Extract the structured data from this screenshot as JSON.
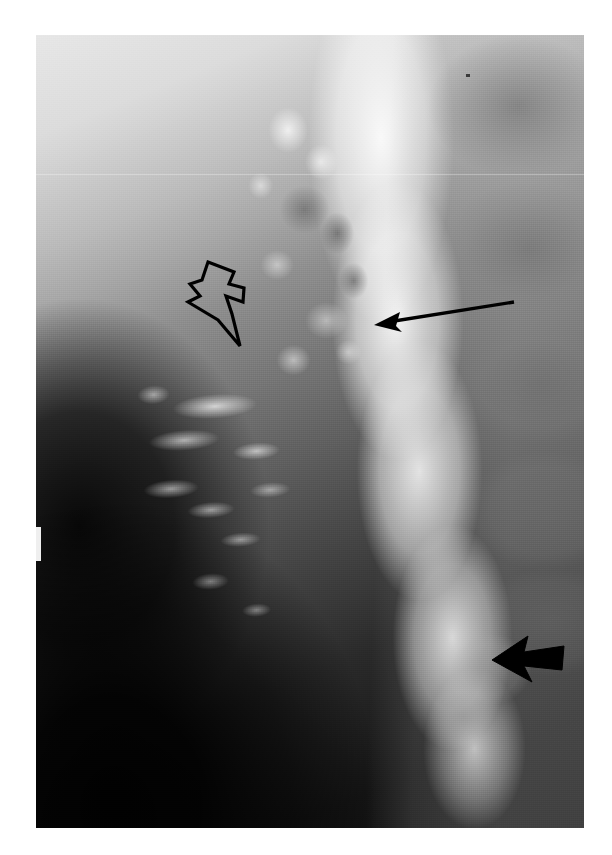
{
  "figure": {
    "kind": "radiograph",
    "modality": "Barium contrast study (esophagram), lateral projection",
    "caption": "",
    "background_color": "#ffffff",
    "plate": {
      "x": 36,
      "y": 35,
      "width": 548,
      "height": 793,
      "tone_light": "#e7e7e7",
      "tone_mid": "#8e8e8e",
      "tone_dark": "#0c0c0c",
      "contrast_column_color": "#ffffff"
    }
  },
  "annotations": [
    {
      "id": "open-arrow",
      "style": "hollow-outline",
      "label": "",
      "color": "#000000",
      "stroke_width": 3,
      "direction": "down-left",
      "x": 182,
      "y": 258,
      "width": 72,
      "height": 98
    },
    {
      "id": "thin-arrow",
      "style": "thin-line",
      "label": "",
      "color": "#000000",
      "stroke_width": 3,
      "direction": "left",
      "x": 366,
      "y": 292,
      "width": 152,
      "height": 42
    },
    {
      "id": "solid-arrow",
      "style": "solid-filled",
      "label": "",
      "color": "#000000",
      "stroke_width": 0,
      "direction": "left",
      "x": 488,
      "y": 630,
      "width": 80,
      "height": 58
    }
  ],
  "colors": {
    "page": "#ffffff",
    "ink": "#000000",
    "film_highlight": "#f2f2f2",
    "film_shadow": "#0a0a0a"
  }
}
